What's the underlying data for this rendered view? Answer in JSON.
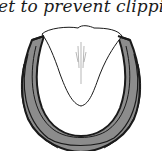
{
  "document": {
    "caption_fragment": "et to prevent clippi",
    "figure": {
      "subject": "horseshoe-on-hoof-sole",
      "colors": {
        "shoe_fill": "#8c8c8c",
        "outline": "#1a1a1a",
        "sole": "#ffffff"
      }
    }
  }
}
